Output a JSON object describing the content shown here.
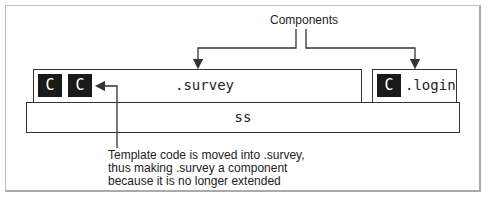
{
  "diagram": {
    "title_label": "Components",
    "ss_layer": {
      "label": "ss"
    },
    "survey_module": {
      "label": ".survey",
      "components": [
        "C",
        "C"
      ]
    },
    "login_module": {
      "label": ".login",
      "components": [
        "C"
      ]
    },
    "annotation": {
      "lines": [
        "Template code is moved into .survey,",
        "thus making .survey a component",
        "because it is no longer extended"
      ]
    },
    "colors": {
      "component_fill": "#1a1a1a",
      "line": "#333333",
      "frame": "#bdbdbd"
    }
  }
}
